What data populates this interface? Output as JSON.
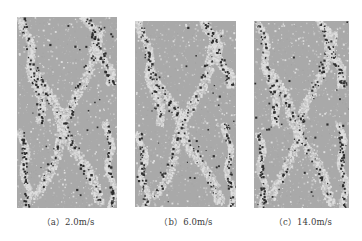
{
  "figure": {
    "background": "#ffffff",
    "colors": {
      "matrix_gray": "#a9a9a9",
      "fracture_light": "#dedede",
      "fracture_mid": "#c6c6c6",
      "particle_dark": "#2e2e2e",
      "caption_text": "#3a3a3a"
    },
    "panels": [
      {
        "id": "a",
        "label": "(a)",
        "velocity": "2.0m/s",
        "caption": "（a）2.0m/s",
        "box": {
          "left": 17,
          "top": 17,
          "width": 100,
          "height": 191
        },
        "seed": 11,
        "caption_center_x": 68
      },
      {
        "id": "b",
        "label": "(b)",
        "velocity": "6.0m/s",
        "caption": "（b）6.0m/s",
        "box": {
          "left": 135,
          "top": 21,
          "width": 101,
          "height": 186
        },
        "seed": 23,
        "caption_center_x": 186
      },
      {
        "id": "c",
        "label": "(c)",
        "velocity": "14.0m/s",
        "caption": "（c）14.0m/s",
        "box": {
          "left": 254,
          "top": 21,
          "width": 95,
          "height": 187
        },
        "seed": 37,
        "caption_center_x": 303
      }
    ]
  }
}
